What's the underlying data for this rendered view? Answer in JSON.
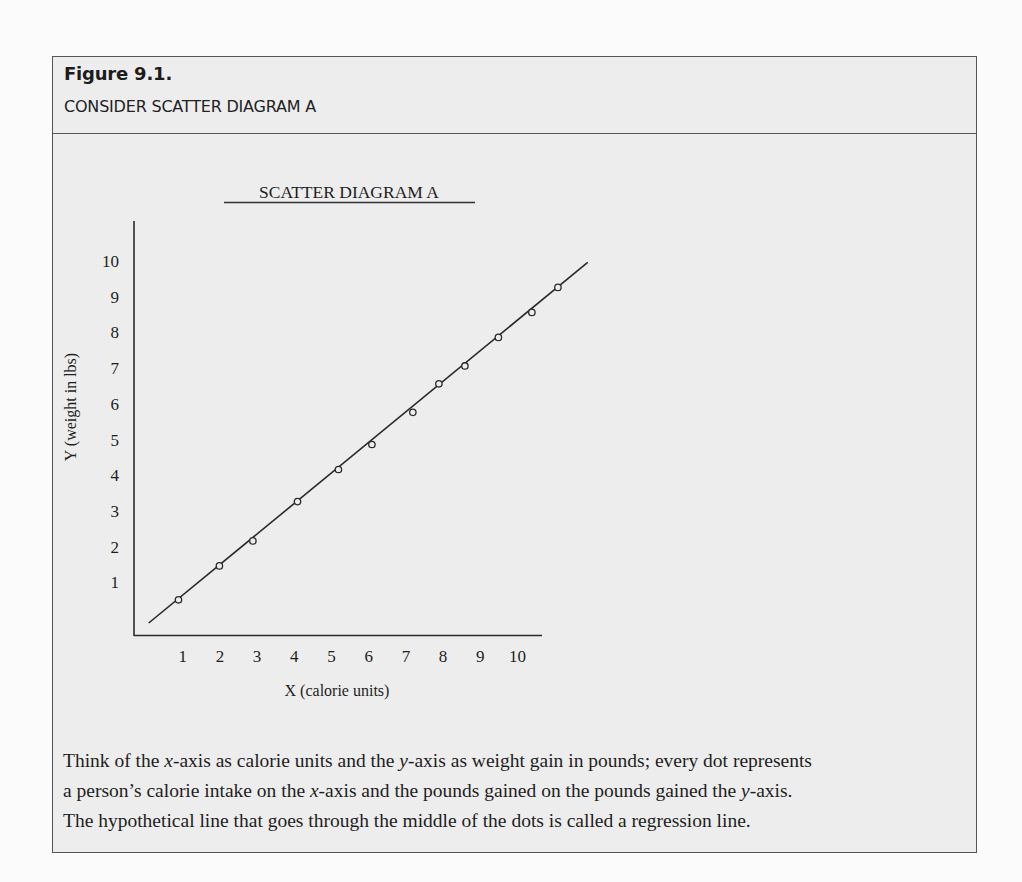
{
  "figure": {
    "number": "Figure 9.1.",
    "subtitle": "CONSIDER SCATTER DIAGRAM A"
  },
  "chart_data": {
    "type": "scatter",
    "title": "SCATTER DIAGRAM A",
    "xlabel": "X (calorie units)",
    "ylabel": "Y (weight in lbs)",
    "x_ticks": [
      1,
      2,
      3,
      4,
      5,
      6,
      7,
      8,
      9,
      10
    ],
    "y_ticks": [
      1,
      2,
      3,
      4,
      5,
      6,
      7,
      8,
      9,
      10
    ],
    "xlim": [
      0,
      10.7
    ],
    "ylim": [
      0,
      11.3
    ],
    "grid": false,
    "legend": null,
    "series": [
      {
        "name": "observations",
        "marker": "open-circle",
        "points": [
          [
            0.9,
            0.65
          ],
          [
            2.0,
            1.6
          ],
          [
            2.9,
            2.3
          ],
          [
            4.1,
            3.4
          ],
          [
            5.2,
            4.3
          ],
          [
            6.1,
            5.0
          ],
          [
            7.2,
            5.9
          ],
          [
            7.9,
            6.7
          ],
          [
            8.6,
            7.2
          ],
          [
            9.5,
            8.0
          ],
          [
            10.4,
            8.7
          ],
          [
            11.1,
            9.4
          ]
        ]
      }
    ],
    "regression_line": {
      "from": [
        0.1,
        0.0
      ],
      "to": [
        11.9,
        10.1
      ]
    }
  },
  "caption": {
    "line1": [
      "Think of the ",
      "x",
      "-axis as calorie units and the ",
      "y",
      "-axis as weight gain in pounds; every dot represents"
    ],
    "line2": [
      "a person’s calorie intake on the ",
      "x",
      "-axis and the pounds gained on the pounds gained the ",
      "y",
      "-axis."
    ],
    "line3": "The hypothetical line that goes through the middle of the dots is called a regression line."
  }
}
